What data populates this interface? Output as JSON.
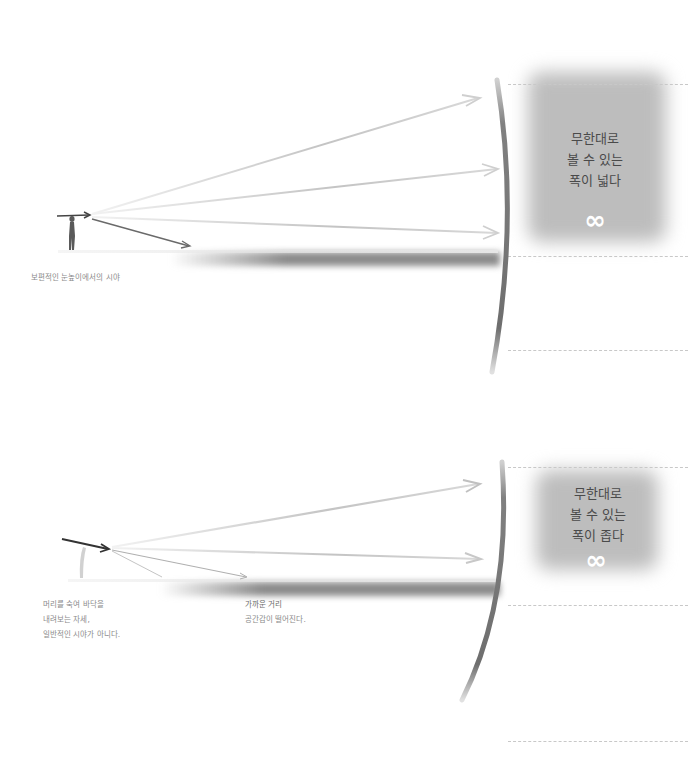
{
  "panels": [
    {
      "id": "normal-eye-level",
      "caption_lines": [
        "보편적인 눈높이에서의 시야"
      ],
      "zone_text_lines": [
        "무한대로",
        "볼 수 있는",
        "폭이 넓다"
      ],
      "zone_symbol": "∞"
    },
    {
      "id": "head-down",
      "caption_lines": [
        "머리를 숙여 바닥을",
        "내려보는 자세,",
        "일반적인 시야가 아니다."
      ],
      "secondary_caption_lines": [
        "가까운 거리",
        "공간감이 떨어진다."
      ],
      "zone_text_lines": [
        "무한대로",
        "볼 수 있는",
        "폭이 좁다"
      ],
      "zone_symbol": "∞"
    }
  ],
  "colors": {
    "arrow_light": "#d0d0d0",
    "arrow_dark": "#555555",
    "curve": "#7a7a7a",
    "zone": "#bdbdbd",
    "dash": "#c8c8c8",
    "text": "#4a4a4a",
    "caption": "#8a8a8a"
  }
}
